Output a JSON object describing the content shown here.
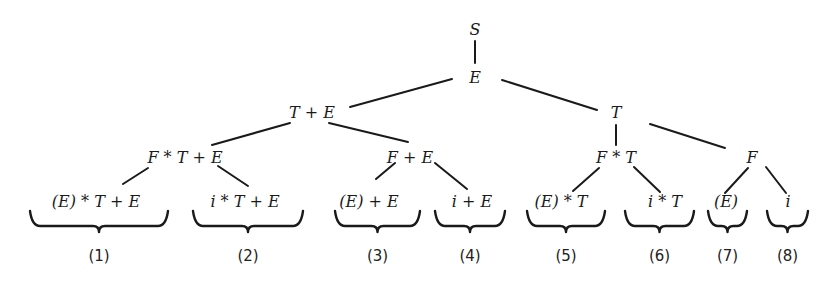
{
  "diagram": {
    "type": "derivation-tree",
    "nodes": [
      {
        "id": "S",
        "text": "S",
        "x": 475,
        "y": 30
      },
      {
        "id": "E",
        "text": "E",
        "x": 475,
        "y": 78
      },
      {
        "id": "TpE",
        "text": "T + E",
        "x": 312,
        "y": 113
      },
      {
        "id": "T",
        "text": "T",
        "x": 616,
        "y": 113
      },
      {
        "id": "FsTpE",
        "text": "F * T + E",
        "x": 185,
        "y": 158
      },
      {
        "id": "FpE",
        "text": "F + E",
        "x": 410,
        "y": 158
      },
      {
        "id": "FsT",
        "text": "F * T",
        "x": 616,
        "y": 158
      },
      {
        "id": "F",
        "text": "F",
        "x": 752,
        "y": 158
      }
    ],
    "leaves": [
      {
        "id": "L1",
        "text": "(E) * T + E",
        "x": 96,
        "y": 202,
        "brace": [
          30,
          168
        ],
        "label": "(1)"
      },
      {
        "id": "L2",
        "text": "i * T + E",
        "x": 245,
        "y": 202,
        "brace": [
          193,
          303
        ],
        "label": "(2)"
      },
      {
        "id": "L3",
        "text": "(E) + E",
        "x": 369,
        "y": 202,
        "brace": [
          335,
          420
        ],
        "label": "(3)"
      },
      {
        "id": "L4",
        "text": "i + E",
        "x": 472,
        "y": 202,
        "brace": [
          435,
          505
        ],
        "label": "(4)"
      },
      {
        "id": "L5",
        "text": "(E) * T",
        "x": 561,
        "y": 202,
        "brace": [
          527,
          605
        ],
        "label": "(5)"
      },
      {
        "id": "L6",
        "text": "i * T",
        "x": 665,
        "y": 202,
        "brace": [
          625,
          694
        ],
        "label": "(6)"
      },
      {
        "id": "L7",
        "text": "(E)",
        "x": 726,
        "y": 202,
        "brace": [
          708,
          747
        ],
        "label": "(7)"
      },
      {
        "id": "L8",
        "text": "i",
        "x": 788,
        "y": 202,
        "brace": [
          767,
          808
        ],
        "label": "(8)"
      }
    ],
    "edges": [
      {
        "from": "S",
        "to": "E",
        "x1": 475,
        "y1": 41,
        "x2": 475,
        "y2": 63
      },
      {
        "from": "E",
        "to": "TpE",
        "x1": 452,
        "y1": 79,
        "x2": 350,
        "y2": 107
      },
      {
        "from": "E",
        "to": "T",
        "x1": 502,
        "y1": 80,
        "x2": 597,
        "y2": 110
      },
      {
        "from": "TpE",
        "to": "FsTpE",
        "x1": 290,
        "y1": 123,
        "x2": 212,
        "y2": 145
      },
      {
        "from": "TpE",
        "to": "FpE",
        "x1": 329,
        "y1": 123,
        "x2": 408,
        "y2": 142
      },
      {
        "from": "T",
        "to": "FsT",
        "x1": 616,
        "y1": 125,
        "x2": 616,
        "y2": 145
      },
      {
        "from": "T",
        "to": "F",
        "x1": 650,
        "y1": 124,
        "x2": 725,
        "y2": 148
      },
      {
        "from": "FsTpE",
        "to": "L1",
        "x1": 148,
        "y1": 168,
        "x2": 123,
        "y2": 184
      },
      {
        "from": "FsTpE",
        "to": "L2",
        "x1": 218,
        "y1": 166,
        "x2": 248,
        "y2": 186
      },
      {
        "from": "FpE",
        "to": "L3",
        "x1": 395,
        "y1": 163,
        "x2": 376,
        "y2": 179
      },
      {
        "from": "FpE",
        "to": "L4",
        "x1": 435,
        "y1": 163,
        "x2": 467,
        "y2": 189
      },
      {
        "from": "FsT",
        "to": "L5",
        "x1": 599,
        "y1": 168,
        "x2": 573,
        "y2": 191
      },
      {
        "from": "FsT",
        "to": "L6",
        "x1": 634,
        "y1": 167,
        "x2": 660,
        "y2": 192
      },
      {
        "from": "F",
        "to": "L7",
        "x1": 748,
        "y1": 168,
        "x2": 725,
        "y2": 193
      },
      {
        "from": "F",
        "to": "L8",
        "x1": 766,
        "y1": 167,
        "x2": 786,
        "y2": 193
      }
    ]
  }
}
